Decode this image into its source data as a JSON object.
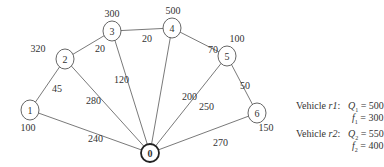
{
  "diagram": {
    "nodes": [
      {
        "id": "0",
        "label": "0",
        "demand": null,
        "depot": true
      },
      {
        "id": "1",
        "label": "1",
        "demand": "100"
      },
      {
        "id": "2",
        "label": "2",
        "demand": "320"
      },
      {
        "id": "3",
        "label": "3",
        "demand": "300"
      },
      {
        "id": "4",
        "label": "4",
        "demand": "500"
      },
      {
        "id": "5",
        "label": "5",
        "demand": "100"
      },
      {
        "id": "6",
        "label": "6",
        "demand": "150"
      }
    ],
    "edges": [
      {
        "from": "0",
        "to": "1",
        "weight": "240"
      },
      {
        "from": "1",
        "to": "2",
        "weight": "45"
      },
      {
        "from": "2",
        "to": "3",
        "weight": "20"
      },
      {
        "from": "3",
        "to": "4",
        "weight": "20"
      },
      {
        "from": "4",
        "to": "5",
        "weight": "70"
      },
      {
        "from": "5",
        "to": "6",
        "weight": "50"
      },
      {
        "from": "0",
        "to": "2",
        "weight": "280"
      },
      {
        "from": "0",
        "to": "3",
        "weight": "120"
      },
      {
        "from": "0",
        "to": "4",
        "weight": "200"
      },
      {
        "from": "0",
        "to": "5",
        "weight": "250"
      },
      {
        "from": "0",
        "to": "6",
        "weight": "270"
      }
    ]
  },
  "legend": {
    "vehicles": [
      {
        "name": "Vehicle ",
        "id": "r1",
        "q_sym": "Q",
        "q_sub": "1",
        "q_val": " = 500",
        "f_sym": "f",
        "f_sub": "1",
        "f_val": " = 300"
      },
      {
        "name": "Vehicle ",
        "id": "r2",
        "q_sym": "Q",
        "q_sub": "2",
        "q_val": " = 550",
        "f_sym": "f",
        "f_sub": "2",
        "f_val": " = 400"
      }
    ]
  }
}
